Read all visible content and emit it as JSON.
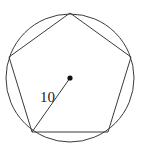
{
  "diagram": {
    "radius_label": "10",
    "stroke_color": "#3a3a3a",
    "circle": {
      "cx": 70,
      "cy": 78,
      "r": 64
    },
    "pentagon_vertices": [
      [
        70,
        13
      ],
      [
        9,
        57
      ],
      [
        32,
        132
      ],
      [
        108,
        132
      ],
      [
        131,
        57
      ]
    ],
    "center": [
      70,
      78
    ],
    "radius_endpoint": [
      32,
      132
    ]
  }
}
